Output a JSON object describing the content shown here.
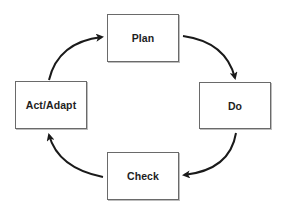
{
  "diagram": {
    "type": "cycle",
    "nodes": [
      {
        "id": "plan",
        "label": "Plan"
      },
      {
        "id": "do",
        "label": "Do"
      },
      {
        "id": "check",
        "label": "Check"
      },
      {
        "id": "act",
        "label": "Act/Adapt"
      }
    ],
    "edges": [
      {
        "from": "plan",
        "to": "do"
      },
      {
        "from": "do",
        "to": "check"
      },
      {
        "from": "check",
        "to": "act"
      },
      {
        "from": "act",
        "to": "plan"
      }
    ],
    "colors": {
      "arrow": "#1a1a1a",
      "box_border": "#6a6a6a",
      "text": "#1e1e1e",
      "background": "#ffffff"
    }
  }
}
